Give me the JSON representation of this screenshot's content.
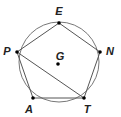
{
  "diagram": {
    "circle": {
      "cx": 59,
      "cy": 62,
      "r": 40,
      "stroke": "#777777"
    },
    "center_point": {
      "label": "G",
      "x": 58,
      "y": 64,
      "label_x": 60,
      "label_y": 60
    },
    "points": [
      {
        "label": "E",
        "x": 59,
        "y": 23,
        "label_x": 59,
        "label_y": 15
      },
      {
        "label": "N",
        "x": 100,
        "y": 52,
        "label_x": 110,
        "label_y": 55
      },
      {
        "label": "T",
        "x": 84,
        "y": 98,
        "label_x": 87,
        "label_y": 113
      },
      {
        "label": "A",
        "x": 33,
        "y": 98,
        "label_x": 29,
        "label_y": 113
      },
      {
        "label": "P",
        "x": 17,
        "y": 52,
        "label_x": 7,
        "label_y": 55
      }
    ],
    "polygon_order": [
      "E",
      "N",
      "T",
      "A",
      "P"
    ],
    "extra_segments": [
      [
        "P",
        "T"
      ]
    ],
    "line_color": "#555555"
  }
}
